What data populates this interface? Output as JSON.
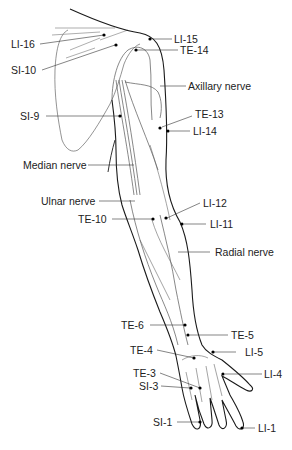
{
  "labels": {
    "LI16": "LI-16",
    "LI15": "LI-15",
    "TE14": "TE-14",
    "SI10": "SI-10",
    "axillary": "Axillary nerve",
    "SI9": "SI-9",
    "TE13": "TE-13",
    "LI14": "LI-14",
    "median": "Median nerve",
    "ulnar": "Ulnar nerve",
    "LI12": "LI-12",
    "TE10": "TE-10",
    "LI11": "LI-11",
    "radial": "Radial nerve",
    "TE6": "TE-6",
    "TE5": "TE-5",
    "TE4": "TE-4",
    "LI5": "LI-5",
    "TE3": "TE-3",
    "LI4": "LI-4",
    "SI3": "SI-3",
    "SI1": "SI-1",
    "LI1": "LI-1"
  },
  "colors": {
    "outline": "#1a1a1a",
    "nerve": "#555555",
    "point": "#000000"
  }
}
